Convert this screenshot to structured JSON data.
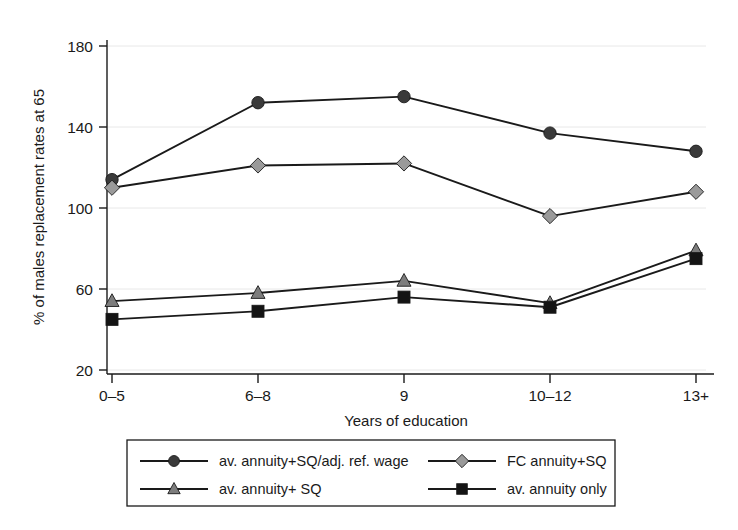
{
  "chart_data": {
    "type": "line",
    "title": "",
    "xlabel": "Years of education",
    "ylabel": "% of males replacement rates at 65",
    "categories": [
      "0–5",
      "6–8",
      "9",
      "10–12",
      "13+"
    ],
    "xticklabels": [
      "0–5",
      "6–8",
      "9",
      "10–12",
      "13+"
    ],
    "yticklabels": [
      "20",
      "60",
      "100",
      "140",
      "180"
    ],
    "yticks": [
      20,
      60,
      100,
      140,
      180
    ],
    "ylim": [
      10,
      192
    ],
    "grid": "horizontal",
    "legend_position": "below-axes",
    "series": [
      {
        "name": "av. annuity+SQ/adj. ref. wage",
        "marker": "circle",
        "marker_color": "#3a3a3a",
        "line_color": "#1a1a1a",
        "values": [
          114,
          152,
          155,
          137,
          128
        ]
      },
      {
        "name": "FC annuity+SQ",
        "marker": "diamond",
        "marker_color": "#9a9a9a",
        "line_color": "#1a1a1a",
        "values": [
          110,
          121,
          122,
          96,
          108
        ]
      },
      {
        "name": "av. annuity+ SQ",
        "marker": "triangle",
        "marker_color": "#7d7d7d",
        "line_color": "#1a1a1a",
        "values": [
          54,
          58,
          64,
          53,
          79
        ]
      },
      {
        "name": "av. annuity only",
        "marker": "square",
        "marker_color": "#141414",
        "line_color": "#1a1a1a",
        "values": [
          45,
          49,
          56,
          51,
          75
        ]
      }
    ]
  },
  "legend": {
    "entries": [
      {
        "label": "av. annuity+SQ/adj. ref. wage",
        "marker": "circle",
        "color": "#3a3a3a"
      },
      {
        "label": "FC annuity+SQ",
        "marker": "diamond",
        "color": "#9a9a9a"
      },
      {
        "label": "av. annuity+ SQ",
        "marker": "triangle",
        "color": "#7d7d7d"
      },
      {
        "label": "av. annuity only",
        "marker": "square",
        "color": "#141414"
      }
    ]
  },
  "colors": {
    "background": "#ffffff",
    "axis": "#1a1a1a",
    "grid": "#e8e8e8"
  }
}
